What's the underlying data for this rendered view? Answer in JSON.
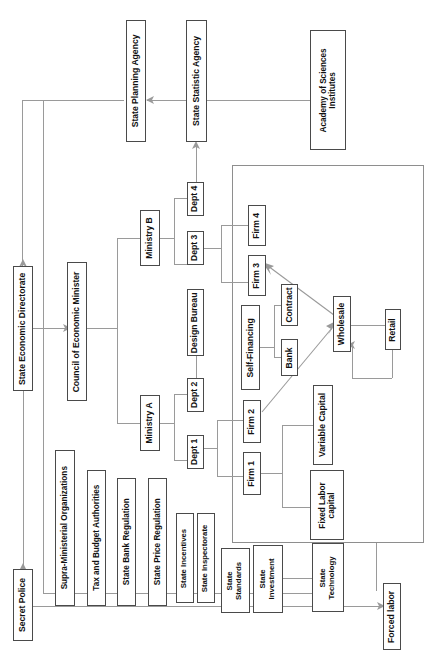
{
  "diagram": {
    "orientation": "rotated-90-ccw",
    "nodes": {
      "state_planning_agency": "State Planning Agency",
      "state_statistic_agency": "State Statistic Agency",
      "academy_of_sciences_institutes": "Academy of Sciences\nInstitutes",
      "state_economic_directorate": "State Economic Directorate",
      "council_of_economic_minister": "Council of Economic Minister",
      "secret_police": "Secret Police",
      "ministry_a": "Ministry A",
      "ministry_b": "Ministry B",
      "dept_1": "Dept 1",
      "dept_2": "Dept 2",
      "dept_3": "Dept 3",
      "dept_4": "Dept 4",
      "design_bureau": "Design Bureau",
      "firm_1": "Firm 1",
      "firm_2": "Firm 2",
      "firm_3": "Firm 3",
      "firm_4": "Firm 4",
      "self_financing": "Self-Financing",
      "bank": "Bank",
      "contract": "Contract",
      "wholesale": "Wholesale",
      "retail": "Retail",
      "variable_capital": "Variable Capital",
      "fixed_labor_capital": "Fixed Labor\ncapital",
      "supra_ministerial_organizations": "Supra-Ministerial Organizations",
      "tax_and_budget_authorities": "Tax and Budget Authorities",
      "state_bank_regulation": "State Bank Regulation",
      "state_price_regulation": "State Price Regulation",
      "state_incentives": "State Incentives",
      "state_inspectorate": "State Inspectorate",
      "state_standards": "State\nStandards",
      "state_investment": "State\nInvestment",
      "state_technology": "State\nTechnology",
      "forced_labor": "Forced labor"
    },
    "colors": {
      "box_border": "#4a4a4a",
      "region_border": "#8e8e8e",
      "connector": "#9a9a9a",
      "background": "#ffffff",
      "text": "#111111"
    }
  }
}
